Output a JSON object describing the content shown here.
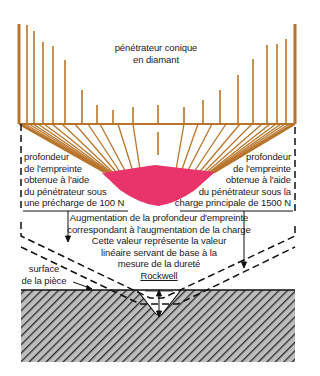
{
  "colors": {
    "penetrator": "#b8742a",
    "imprint": "#e8336b",
    "lines": "#111111",
    "hatch_bg": "#b9b9b9",
    "hatch_stroke": "#2a2a2a"
  },
  "labels": {
    "penetrator": [
      "pénétrateur conique",
      "en diamant"
    ],
    "preload_depth": [
      "profondeur",
      "de l'empreinte",
      "obtenue à l'aide",
      "du pénétrateur sous",
      "une précharge de 100 N"
    ],
    "mainload_depth": [
      "profondeur",
      "de l'empreinte",
      "obtenue à l'aide",
      "du pénétrateur sous la",
      "charge principale de 1500 N"
    ],
    "increase": [
      "Augmentation de la profondeur d'empreinte",
      "correspondant à l'augmentation de la charge",
      "Cette valeur représente la valeur",
      "linéaire servant de base à la",
      "mesure de la dureté",
      "Rockwell"
    ],
    "surface": [
      "surface",
      "de la pièce"
    ]
  },
  "loads": {
    "preload": "100 N",
    "main_load": "1500 N"
  }
}
